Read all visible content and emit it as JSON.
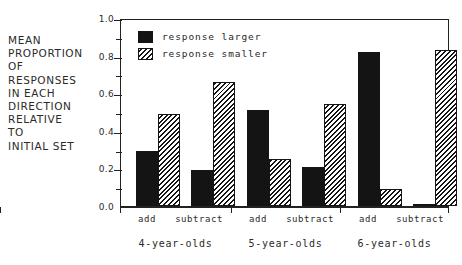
{
  "chart_data": {
    "type": "bar",
    "title": "",
    "xlabel": "",
    "ylabel": "MEAN PROPORTION OF RESPONSES IN EACH DIRECTION RELATIVE TO INITIAL SET",
    "ylabel_lines": [
      "MEAN",
      "PROPORTION",
      "OF",
      "RESPONSES",
      "IN EACH",
      "DIRECTION",
      "RELATIVE",
      "TO",
      "INITIAL SET"
    ],
    "ylim": [
      0.0,
      1.0
    ],
    "ytick_labels": [
      "0.0",
      "0.2",
      "0.4",
      "0.6",
      "0.8",
      "1.0"
    ],
    "ytick_values": [
      0.0,
      0.2,
      0.4,
      0.6,
      0.8,
      1.0
    ],
    "yminor_values": [
      0.1,
      0.3,
      0.5,
      0.7,
      0.9
    ],
    "grid": false,
    "legend_position": "upper-left-inside",
    "legend": [
      {
        "label": "response larger",
        "fill": "solid",
        "color": "#141414"
      },
      {
        "label": "response smaller",
        "fill": "hatch",
        "color": "#141414"
      }
    ],
    "categories": [
      "4-year-olds add",
      "4-year-olds subtract",
      "5-year-olds add",
      "5-year-olds subtract",
      "6-year-olds add",
      "6-year-olds subtract"
    ],
    "condition_labels": [
      "add",
      "subtract",
      "add",
      "subtract",
      "add",
      "subtract"
    ],
    "groups": [
      {
        "name": "4-year-olds",
        "conditions": [
          "add",
          "subtract"
        ]
      },
      {
        "name": "5-year-olds",
        "conditions": [
          "add",
          "subtract"
        ]
      },
      {
        "name": "6-year-olds",
        "conditions": [
          "add",
          "subtract"
        ]
      }
    ],
    "series": [
      {
        "name": "response larger",
        "fill": "solid",
        "values": [
          0.29,
          0.19,
          0.51,
          0.21,
          0.82,
          0.0
        ]
      },
      {
        "name": "response smaller",
        "fill": "hatch",
        "values": [
          0.49,
          0.66,
          0.25,
          0.54,
          0.09,
          0.83
        ]
      }
    ],
    "bars": [
      {
        "group": "4-year-olds",
        "condition": "add",
        "series": "response larger",
        "value": 0.29,
        "fill": "solid"
      },
      {
        "group": "4-year-olds",
        "condition": "add",
        "series": "response smaller",
        "value": 0.49,
        "fill": "hatch"
      },
      {
        "group": "4-year-olds",
        "condition": "subtract",
        "series": "response larger",
        "value": 0.19,
        "fill": "solid"
      },
      {
        "group": "4-year-olds",
        "condition": "subtract",
        "series": "response smaller",
        "value": 0.66,
        "fill": "hatch"
      },
      {
        "group": "5-year-olds",
        "condition": "add",
        "series": "response larger",
        "value": 0.51,
        "fill": "solid"
      },
      {
        "group": "5-year-olds",
        "condition": "add",
        "series": "response smaller",
        "value": 0.25,
        "fill": "hatch"
      },
      {
        "group": "5-year-olds",
        "condition": "subtract",
        "series": "response larger",
        "value": 0.21,
        "fill": "solid"
      },
      {
        "group": "5-year-olds",
        "condition": "subtract",
        "series": "response smaller",
        "value": 0.54,
        "fill": "hatch"
      },
      {
        "group": "6-year-olds",
        "condition": "add",
        "series": "response larger",
        "value": 0.82,
        "fill": "solid"
      },
      {
        "group": "6-year-olds",
        "condition": "add",
        "series": "response smaller",
        "value": 0.09,
        "fill": "hatch"
      },
      {
        "group": "6-year-olds",
        "condition": "subtract",
        "series": "response larger",
        "value": 0.0,
        "fill": "solid"
      },
      {
        "group": "6-year-olds",
        "condition": "subtract",
        "series": "response smaller",
        "value": 0.83,
        "fill": "hatch"
      }
    ]
  }
}
